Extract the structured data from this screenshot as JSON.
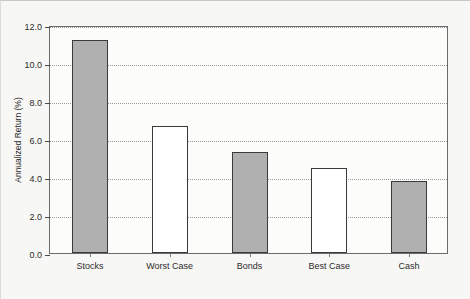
{
  "chart_data": {
    "type": "bar",
    "title": "",
    "xlabel": "",
    "ylabel": "Annualized Return (%)",
    "categories": [
      "Stocks",
      "Worst Case",
      "Bonds",
      "Best Case",
      "Cash"
    ],
    "values": [
      11.2,
      6.7,
      5.3,
      4.5,
      3.8
    ],
    "bar_colors": [
      "#b0b0b0",
      "#ffffff",
      "#b0b0b0",
      "#ffffff",
      "#b0b0b0"
    ],
    "bar_edge_color": "#3a3a3a",
    "ylim": [
      0.0,
      12.0
    ],
    "yticks": [
      0.0,
      2.0,
      4.0,
      6.0,
      8.0,
      10.0,
      12.0
    ],
    "ytick_labels": [
      "0.0",
      "2.0",
      "4.0",
      "6.0",
      "8.0",
      "10.0",
      "12.0"
    ],
    "grid": true,
    "grid_style": "dotted",
    "grid_color": "#9a9a9a",
    "legend": null,
    "background_color": "#f7f7f5",
    "plot_background_color": "#fcfcfb",
    "plot_border_color": "#6b6b6b"
  }
}
